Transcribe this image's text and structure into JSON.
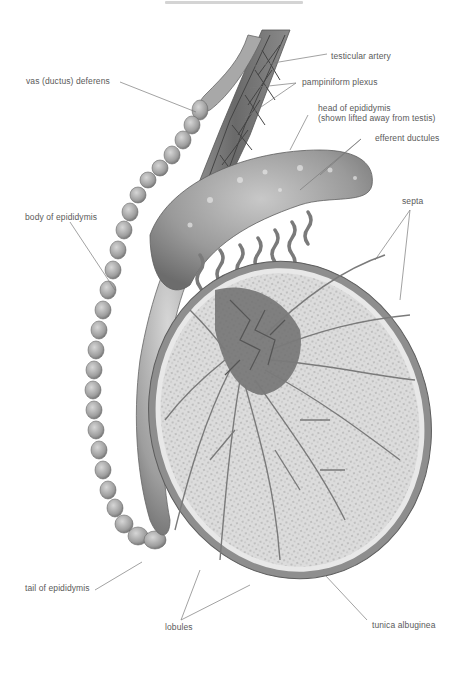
{
  "figure": {
    "type": "anatomical-illustration",
    "colors": {
      "background": "#ffffff",
      "label_text": "#5a5a5a",
      "leader_line": "#7a7a7a",
      "tissue_dark": "#6e6e6e",
      "tissue_mid": "#9a9a9a",
      "tissue_light": "#cfcfcf",
      "lobule_fill": "#d9d9d9"
    }
  },
  "labels": {
    "testicular_artery": "testicular artery",
    "vas_deferens": "vas (ductus) deferens",
    "pampiniform_plexus": "pampiniform plexus",
    "head_of_epididymis_line1": "head of epididymis",
    "head_of_epididymis_line2": "(shown lifted away from testis)",
    "efferent_ductules": "efferent ductules",
    "septa": "septa",
    "body_of_epididymis": "body of epididymis",
    "tail_of_epididymis": "tail of epididymis",
    "lobules": "lobules",
    "tunica_albuginea": "tunica albuginea"
  }
}
